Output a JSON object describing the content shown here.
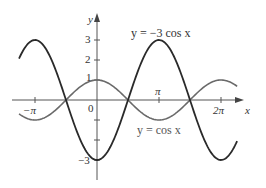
{
  "chart_data": {
    "type": "line",
    "title": "",
    "xlabel": "x",
    "ylabel": "y",
    "xlim": [
      -4.2,
      7.4
    ],
    "ylim": [
      -3.6,
      3.6
    ],
    "grid": false,
    "x_ticks": [
      {
        "value": -3.14159,
        "label": "−π"
      },
      {
        "value": 3.14159,
        "label": "π"
      },
      {
        "value": 6.28318,
        "label": "2π"
      }
    ],
    "y_ticks": [
      {
        "value": 1,
        "label": "1"
      },
      {
        "value": 2,
        "label": "2"
      },
      {
        "value": 3,
        "label": "3"
      },
      {
        "value": -1,
        "label": ""
      },
      {
        "value": -2,
        "label": ""
      },
      {
        "value": -3,
        "label": "−3"
      }
    ],
    "origin_label": "0",
    "series": [
      {
        "name": "y = −3 cos x",
        "function": "-3*cos(x)",
        "color": "#2a2a2a",
        "x_range": [
          -3.95,
          7.1
        ]
      },
      {
        "name": "y = cos x",
        "function": "cos(x)",
        "color": "#6a6a6a",
        "x_range": [
          -3.95,
          7.1
        ]
      }
    ],
    "annotations": [
      {
        "text": "y = −3 cos x",
        "near_series": 0
      },
      {
        "text": "y = cos x",
        "near_series": 1
      }
    ]
  },
  "labels": {
    "y_axis": "y",
    "x_axis": "x",
    "origin": "0",
    "tick_pi_neg": "−π",
    "tick_pi": "π",
    "tick_2pi": "2π",
    "tick_1": "1",
    "tick_2": "2",
    "tick_3": "3",
    "tick_neg3": "−3",
    "eq_neg3cos": "y = −3 cos x",
    "eq_cos": "y = cos x"
  }
}
